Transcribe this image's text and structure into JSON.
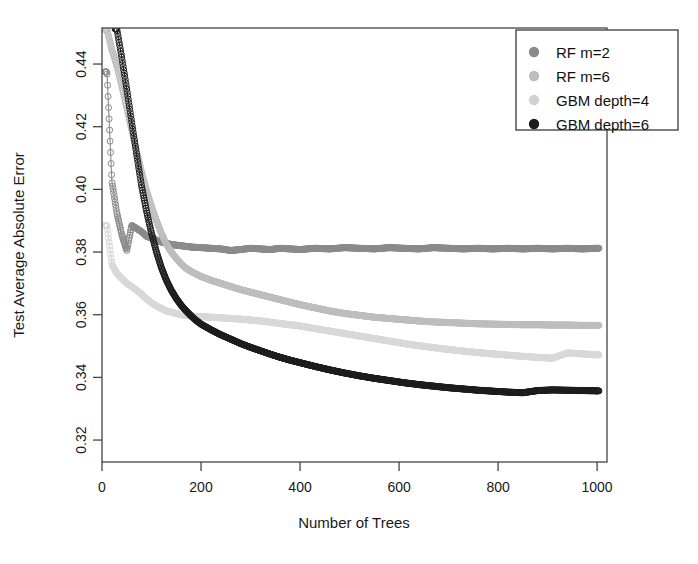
{
  "chart_data": {
    "type": "scatter",
    "title": "",
    "xlabel": "Number of Trees",
    "ylabel": "Test Average Absolute Error",
    "xlim": [
      0,
      1020
    ],
    "ylim": [
      0.313,
      0.4515
    ],
    "xticks": [
      0,
      200,
      400,
      600,
      800,
      1000
    ],
    "xtick_labels": [
      "0",
      "200",
      "400",
      "600",
      "800",
      "1000"
    ],
    "yticks": [
      0.32,
      0.34,
      0.36,
      0.38,
      0.4,
      0.42,
      0.44
    ],
    "ytick_labels": [
      "0.32",
      "0.34",
      "0.36",
      "0.38",
      "0.40",
      "0.42",
      "0.44"
    ],
    "grid": false,
    "legend_position": "top-right",
    "marker": "open-circle",
    "series": [
      {
        "name": "RF m=2",
        "color": "#8a8a8a",
        "x": [
          10,
          20,
          30,
          40,
          50,
          60,
          70,
          80,
          90,
          100,
          110,
          120,
          130,
          140,
          150,
          160,
          170,
          180,
          190,
          200,
          220,
          240,
          260,
          280,
          300,
          320,
          340,
          360,
          380,
          400,
          430,
          460,
          490,
          520,
          550,
          580,
          610,
          640,
          670,
          700,
          730,
          760,
          790,
          820,
          850,
          880,
          910,
          940,
          970,
          1000
        ],
        "y": [
          0.4375,
          0.4025,
          0.3925,
          0.3855,
          0.3805,
          0.3885,
          0.3875,
          0.3865,
          0.385,
          0.3845,
          0.3838,
          0.3832,
          0.3828,
          0.3824,
          0.3822,
          0.382,
          0.3818,
          0.3816,
          0.3815,
          0.3814,
          0.3812,
          0.381,
          0.3805,
          0.3808,
          0.3812,
          0.381,
          0.3808,
          0.3812,
          0.381,
          0.3808,
          0.3812,
          0.381,
          0.3814,
          0.3812,
          0.381,
          0.3814,
          0.3812,
          0.381,
          0.3814,
          0.3812,
          0.381,
          0.3812,
          0.381,
          0.3812,
          0.381,
          0.3812,
          0.381,
          0.3812,
          0.381,
          0.3812
        ]
      },
      {
        "name": "RF m=6",
        "color": "#bdbdbd",
        "x": [
          10,
          20,
          30,
          40,
          50,
          60,
          70,
          80,
          90,
          100,
          110,
          120,
          130,
          140,
          150,
          160,
          170,
          180,
          190,
          200,
          220,
          240,
          260,
          280,
          300,
          320,
          340,
          360,
          380,
          400,
          430,
          460,
          490,
          520,
          550,
          580,
          610,
          640,
          670,
          700,
          730,
          760,
          790,
          820,
          850,
          880,
          910,
          940,
          970,
          1000
        ],
        "y": [
          0.451,
          0.4445,
          0.4395,
          0.433,
          0.426,
          0.419,
          0.412,
          0.4055,
          0.3995,
          0.3945,
          0.39,
          0.386,
          0.3825,
          0.38,
          0.378,
          0.3762,
          0.3748,
          0.3738,
          0.373,
          0.3722,
          0.371,
          0.37,
          0.369,
          0.368,
          0.3672,
          0.3664,
          0.3656,
          0.3648,
          0.364,
          0.3632,
          0.3622,
          0.3612,
          0.3604,
          0.3598,
          0.3592,
          0.3588,
          0.3584,
          0.358,
          0.3577,
          0.3575,
          0.3573,
          0.3571,
          0.357,
          0.3569,
          0.3568,
          0.3568,
          0.3567,
          0.3567,
          0.3566,
          0.3566
        ]
      },
      {
        "name": "GBM depth=4",
        "color": "#d8d8d8",
        "x": [
          10,
          20,
          30,
          40,
          50,
          60,
          70,
          80,
          90,
          100,
          110,
          120,
          130,
          140,
          150,
          160,
          170,
          180,
          190,
          200,
          220,
          240,
          260,
          280,
          300,
          320,
          340,
          360,
          380,
          400,
          430,
          460,
          490,
          520,
          550,
          580,
          610,
          640,
          670,
          700,
          730,
          760,
          790,
          820,
          850,
          880,
          910,
          940,
          970,
          1000
        ],
        "y": [
          0.3885,
          0.376,
          0.3732,
          0.3715,
          0.37,
          0.369,
          0.3678,
          0.3665,
          0.365,
          0.3638,
          0.3628,
          0.362,
          0.3612,
          0.3608,
          0.3604,
          0.36,
          0.3598,
          0.3596,
          0.3595,
          0.3594,
          0.3592,
          0.359,
          0.3588,
          0.3586,
          0.3583,
          0.358,
          0.3576,
          0.3572,
          0.3568,
          0.3564,
          0.3556,
          0.3548,
          0.354,
          0.3532,
          0.3524,
          0.3516,
          0.3508,
          0.3501,
          0.3495,
          0.3489,
          0.3484,
          0.3479,
          0.3475,
          0.3471,
          0.3467,
          0.3464,
          0.3461,
          0.3478,
          0.3475,
          0.3472
        ]
      },
      {
        "name": "GBM depth=6",
        "color": "#1c1c1c",
        "x": [
          30,
          40,
          50,
          60,
          70,
          80,
          90,
          100,
          110,
          120,
          130,
          140,
          150,
          160,
          170,
          180,
          190,
          200,
          220,
          240,
          260,
          280,
          300,
          320,
          340,
          360,
          380,
          400,
          430,
          460,
          490,
          520,
          550,
          580,
          610,
          640,
          670,
          700,
          730,
          760,
          790,
          820,
          850,
          880,
          910,
          940,
          970,
          1000
        ],
        "y": [
          0.4512,
          0.442,
          0.432,
          0.4215,
          0.411,
          0.401,
          0.393,
          0.386,
          0.38,
          0.375,
          0.371,
          0.3678,
          0.3652,
          0.363,
          0.3612,
          0.3596,
          0.3582,
          0.357,
          0.3552,
          0.3536,
          0.3522,
          0.3508,
          0.3496,
          0.3485,
          0.3474,
          0.3464,
          0.3455,
          0.3447,
          0.3435,
          0.3424,
          0.3414,
          0.3405,
          0.3397,
          0.339,
          0.3383,
          0.3377,
          0.3372,
          0.3367,
          0.3363,
          0.3359,
          0.3356,
          0.3353,
          0.3351,
          0.3358,
          0.336,
          0.3359,
          0.3358,
          0.3357
        ]
      }
    ]
  },
  "legend": {
    "items": [
      {
        "label": "RF m=2",
        "color": "#8a8a8a"
      },
      {
        "label": "RF m=6",
        "color": "#bdbdbd"
      },
      {
        "label": "GBM depth=4",
        "color": "#d0d0d0"
      },
      {
        "label": "GBM depth=6",
        "color": "#1c1c1c"
      }
    ]
  },
  "axes": {
    "x_title": "Number of Trees",
    "y_title": "Test Average Absolute Error"
  }
}
